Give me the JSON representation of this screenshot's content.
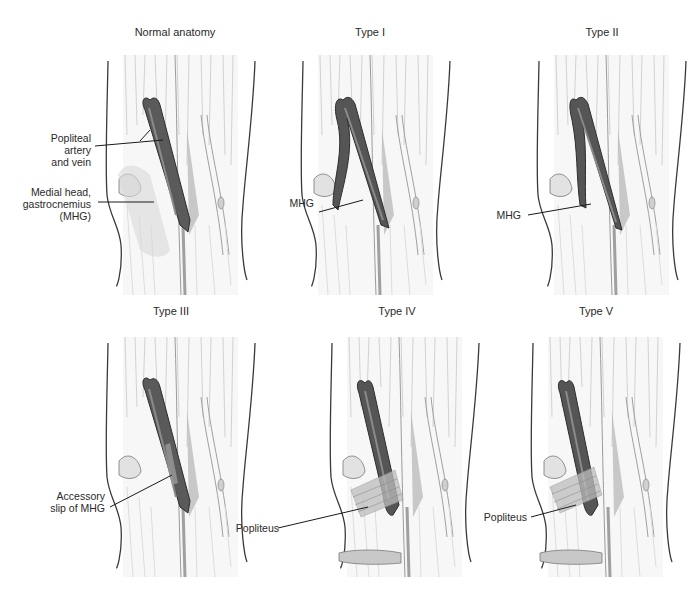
{
  "figure": {
    "panels": [
      {
        "id": "normal",
        "title": "Normal anatomy",
        "labels": [
          {
            "lines": [
              "Popliteal",
              "artery",
              "and vein"
            ]
          },
          {
            "lines": [
              "Medial head,",
              "gastrocnemius",
              "(MHG)"
            ]
          }
        ]
      },
      {
        "id": "type-1",
        "title": "Type I",
        "labels": [
          {
            "lines": [
              "MHG"
            ]
          }
        ]
      },
      {
        "id": "type-2",
        "title": "Type II",
        "labels": [
          {
            "lines": [
              "MHG"
            ]
          }
        ]
      },
      {
        "id": "type-3",
        "title": "Type III",
        "labels": [
          {
            "lines": [
              "Accessory",
              "slip of MHG"
            ]
          }
        ]
      },
      {
        "id": "type-4",
        "title": "Type IV",
        "labels": [
          {
            "lines": [
              "Popliteus"
            ]
          }
        ]
      },
      {
        "id": "type-5",
        "title": "Type V",
        "labels": [
          {
            "lines": [
              "Popliteus"
            ]
          }
        ]
      }
    ],
    "colors": {
      "background": "#ffffff",
      "outline": "#3a3a3a",
      "muscle_light": "#e6e6e6",
      "muscle_mid": "#c8c8c8",
      "vessel_dark": "#4a4a4a",
      "vessel_mid": "#707070",
      "leader_line": "#1a1a1a"
    }
  }
}
